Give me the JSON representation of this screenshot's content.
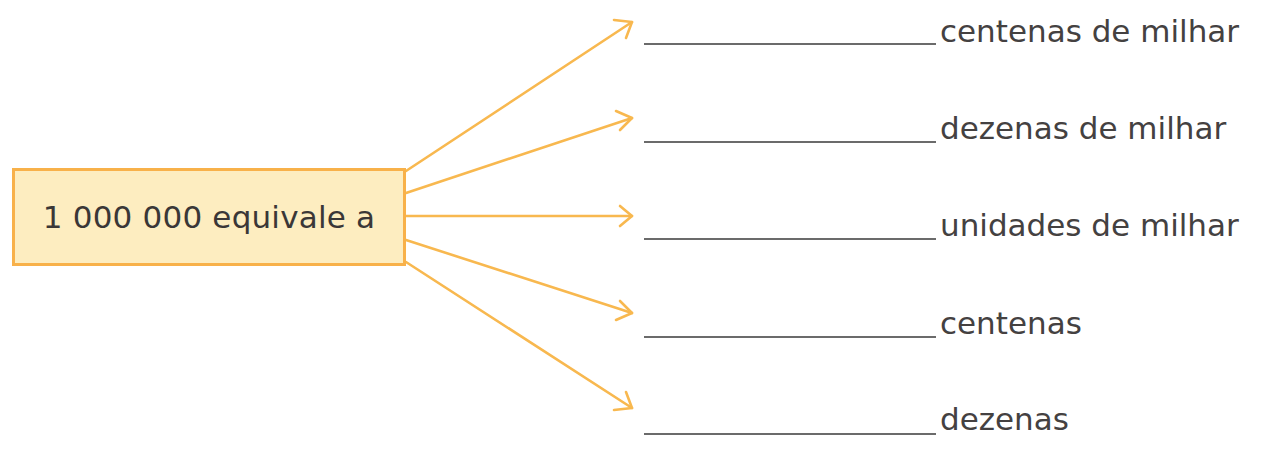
{
  "diagram": {
    "source_box": {
      "text": "1 000 000 equivale a",
      "fill": "#fdedc0",
      "border": "#f8b14a"
    },
    "arrow_color": "#f8b84f",
    "targets": [
      {
        "label": "centenas de milhar",
        "blank": ""
      },
      {
        "label": "dezenas de milhar",
        "blank": ""
      },
      {
        "label": "unidades de milhar",
        "blank": ""
      },
      {
        "label": "centenas",
        "blank": ""
      },
      {
        "label": "dezenas",
        "blank": ""
      }
    ]
  }
}
